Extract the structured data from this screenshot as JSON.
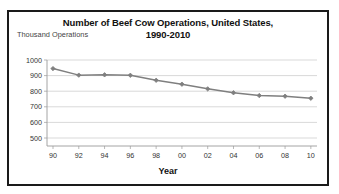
{
  "chart_data": {
    "type": "line",
    "title": "Number of Beef Cow Operations, United States, 1990-2010",
    "title_line1": "Number of Beef Cow Operations, United States,",
    "title_line2": "1990-2010",
    "ylabel": "Thousand Operations",
    "xlabel": "Year",
    "categories": [
      "90",
      "92",
      "94",
      "96",
      "98",
      "00",
      "02",
      "04",
      "06",
      "08",
      "10"
    ],
    "x": [
      1990,
      1992,
      1994,
      1996,
      1998,
      2000,
      2002,
      2004,
      2006,
      2008,
      2010
    ],
    "values": [
      945,
      903,
      905,
      902,
      870,
      845,
      815,
      790,
      772,
      768,
      755
    ],
    "ylim": [
      500,
      1000
    ],
    "ytick_labels": [
      "1000",
      "900",
      "800",
      "700",
      "600",
      "500"
    ],
    "yticks": [
      1000,
      900,
      800,
      700,
      600,
      500
    ],
    "grid": true,
    "legend": "none",
    "series_color": "#7f7f7f",
    "marker": "diamond"
  },
  "colors": {
    "border": "#1a1a1a",
    "grid": "#c8c8c8",
    "axis": "#9a9a9a",
    "line": "#7f7f7f",
    "text": "#111111",
    "ylabel_text": "#444444"
  }
}
